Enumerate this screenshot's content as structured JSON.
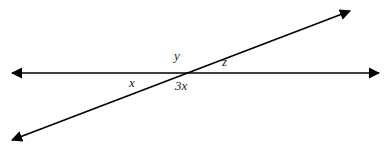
{
  "diagram": {
    "lines": [
      {
        "name": "horizontal-line",
        "x1": 12,
        "y1": 73,
        "x2": 379,
        "y2": 73,
        "arrows": "both"
      },
      {
        "name": "transversal-line",
        "x1": 12,
        "y1": 140,
        "x2": 350,
        "y2": 11,
        "arrows": "both"
      }
    ],
    "angle_labels": {
      "y": "y",
      "z": "z",
      "x": "x",
      "three_x": "3x"
    },
    "colors": {
      "line": "#000000",
      "text": "#222222",
      "background": "#ffffff"
    }
  }
}
